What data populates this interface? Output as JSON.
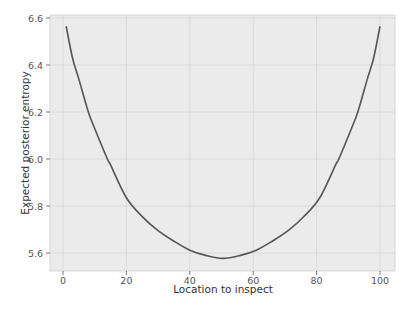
{
  "chart_data": {
    "type": "line",
    "title": "",
    "xlabel": "Location to inspect",
    "ylabel": "Expected posterior entropy",
    "xlim": [
      -3,
      104
    ],
    "ylim": [
      5.53,
      6.61
    ],
    "xticks": [
      0,
      20,
      40,
      60,
      80,
      100
    ],
    "yticks": [
      5.6,
      5.8,
      6.0,
      6.2,
      6.4,
      6.6
    ],
    "xtick_labels": [
      "0",
      "20",
      "40",
      "60",
      "80",
      "100"
    ],
    "ytick_labels": [
      "5.6",
      "5.8",
      "6.0",
      "6.2",
      "6.4",
      "6.6"
    ],
    "grid": true,
    "legend": null,
    "series": [
      {
        "name": "expected entropy",
        "color": "#555555",
        "x": [
          1,
          3,
          5,
          8,
          10,
          14,
          15,
          20,
          25,
          30,
          35,
          40,
          45,
          50.5,
          56,
          61,
          66,
          71,
          76,
          81,
          86,
          87,
          91,
          93,
          96,
          98,
          100
        ],
        "y": [
          6.565,
          6.43,
          6.34,
          6.2,
          6.13,
          6.0,
          5.975,
          5.835,
          5.755,
          5.695,
          5.65,
          5.612,
          5.59,
          5.577,
          5.59,
          5.612,
          5.65,
          5.695,
          5.755,
          5.835,
          5.975,
          6.0,
          6.13,
          6.2,
          6.34,
          6.43,
          6.565
        ]
      }
    ],
    "style": {
      "plot_background": "#ebebeb",
      "grid_color": "#d6d6d6",
      "page_background": "#ffffff"
    }
  }
}
